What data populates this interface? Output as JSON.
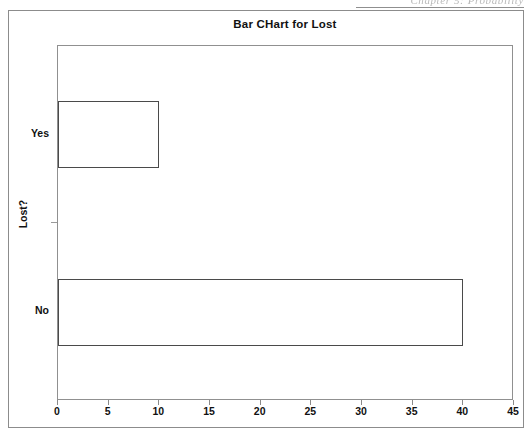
{
  "page": {
    "running_head": "Chapter 5: Probability"
  },
  "chart_data": {
    "type": "bar",
    "orientation": "horizontal",
    "title": "Bar CHart for Lost",
    "xlabel": "",
    "ylabel": "Lost?",
    "categories": [
      "Yes",
      "No"
    ],
    "values": [
      10,
      40
    ],
    "xlim": [
      0,
      45
    ],
    "xticks": [
      0,
      5,
      10,
      15,
      20,
      25,
      30,
      35,
      40,
      45
    ],
    "xtick_labels": [
      "0",
      "5",
      "10",
      "15",
      "20",
      "25",
      "30",
      "35",
      "40",
      "45"
    ],
    "grid": false,
    "legend": false,
    "bar_fill": "#ffffff",
    "bar_edge": "#4a4a4a",
    "frame_color": "#909090",
    "text_color": "#111111"
  }
}
